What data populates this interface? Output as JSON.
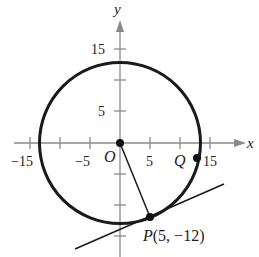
{
  "figure": {
    "type": "circle-with-tangent-line",
    "axes": {
      "x_label": "x",
      "y_label": "y",
      "x_ticks": [
        -15,
        -10,
        -5,
        5,
        10,
        15
      ],
      "x_tick_labels": [
        "−15",
        "−5",
        "5",
        "15"
      ],
      "y_ticks": [
        -15,
        -10,
        -5,
        5,
        10,
        15
      ],
      "y_tick_labels": [
        "15",
        "5"
      ],
      "axis_color": "#8a8a8a"
    },
    "circle": {
      "center": [
        0,
        0
      ],
      "radius": 13,
      "color": "#1a1a1a"
    },
    "points": {
      "origin": {
        "label": "O",
        "coords": [
          0,
          0
        ]
      },
      "P": {
        "label": "P(5, −12)",
        "coords": [
          5,
          -12
        ]
      },
      "Q": {
        "label": "Q",
        "coords": [
          12.85,
          -2
        ]
      }
    },
    "radius_segment": {
      "from": "O",
      "to": "P"
    },
    "tangent_line": {
      "through": "P",
      "slope": 0.4167
    }
  }
}
